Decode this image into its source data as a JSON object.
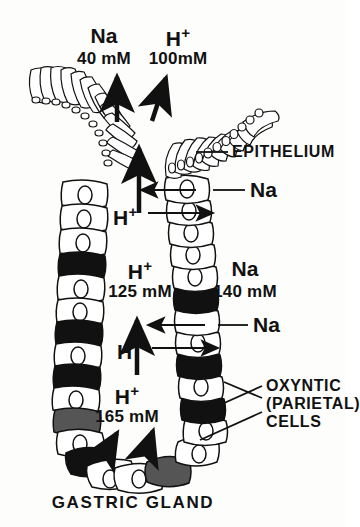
{
  "figure": {
    "title": "GASTRIC GLAND",
    "background_color": "#fdfdfb",
    "ink_color": "#111111",
    "labels": {
      "na_top_ion": "Na",
      "na_top_conc": "40 mM",
      "h_top_ion": "H",
      "h_top_sup": "+",
      "h_top_conc": "100mM",
      "epithelium": "EPITHELIUM",
      "na_upper_arrow": "Na",
      "h_upper_arrow_ion": "H",
      "h_upper_arrow_sup": "+",
      "h_mid_ion": "H",
      "h_mid_sup": "+",
      "h_mid_conc": "125 mM",
      "na_mid_ion": "Na",
      "na_mid_conc": "140 mM",
      "na_lower_arrow": "Na",
      "h_lower_arrow_ion": "H",
      "h_lower_arrow_sup": "+",
      "h_bottom_ion": "H",
      "h_bottom_sup": "+",
      "h_bottom_conc": "165 mM",
      "oxyntic_line1": "OXYNTIC",
      "oxyntic_line2": "(PARIETAL)",
      "oxyntic_line3": "CELLS"
    },
    "diagram": {
      "type": "schematic-biological-drawing",
      "subject": "gastric gland with surface epithelium and oxyntic (parietal) cells",
      "shape": "U-shaped / V-shaped tubular gland opening upward into lumen",
      "cell_fill_light": "#ffffff",
      "cell_fill_dark": "#111111",
      "cell_fill_shaded": "#555555",
      "transport_arrows": [
        {
          "name": "na-secretion-to-lumen",
          "ion": "Na",
          "direction": "up",
          "location": "gland lumen toward stomach"
        },
        {
          "name": "h-secretion-to-lumen",
          "ion": "H+",
          "direction": "up-right",
          "location": "gland lumen toward stomach"
        },
        {
          "name": "lumen-flow-up",
          "ion": "",
          "direction": "up",
          "location": "central gland lumen upper"
        },
        {
          "name": "na-uptake-upper",
          "ion": "Na",
          "direction": "left-into-lumen",
          "location": "upper gland neck"
        },
        {
          "name": "h-secretion-upper",
          "ion": "H+",
          "direction": "right-out-of-cell",
          "location": "upper gland neck"
        },
        {
          "name": "lumen-flow-mid",
          "ion": "",
          "direction": "up",
          "location": "central gland lumen middle"
        },
        {
          "name": "na-uptake-lower",
          "ion": "Na",
          "direction": "left-into-lumen",
          "location": "mid gland"
        },
        {
          "name": "h-secretion-lower",
          "ion": "H+",
          "direction": "right-out-of-cell",
          "location": "mid gland"
        },
        {
          "name": "lumen-flow-base",
          "ion": "",
          "direction": "up",
          "location": "gland base"
        },
        {
          "name": "base-flow-left",
          "ion": "",
          "direction": "up-right",
          "location": "gland base left"
        },
        {
          "name": "base-flow-right",
          "ion": "",
          "direction": "up-right",
          "location": "gland base right"
        }
      ],
      "leader_lines": [
        {
          "name": "epithelium-leader",
          "target": "surface epithelium on right limb"
        },
        {
          "name": "na-upper-leader",
          "target": "upper gland cell"
        },
        {
          "name": "na-lower-leader",
          "target": "mid gland cell"
        },
        {
          "name": "oxyntic-leader-1",
          "target": "dark parietal cell upper"
        },
        {
          "name": "oxyntic-leader-2",
          "target": "dark parietal cell middle"
        },
        {
          "name": "oxyntic-leader-3",
          "target": "dark parietal cell lower"
        }
      ]
    }
  }
}
